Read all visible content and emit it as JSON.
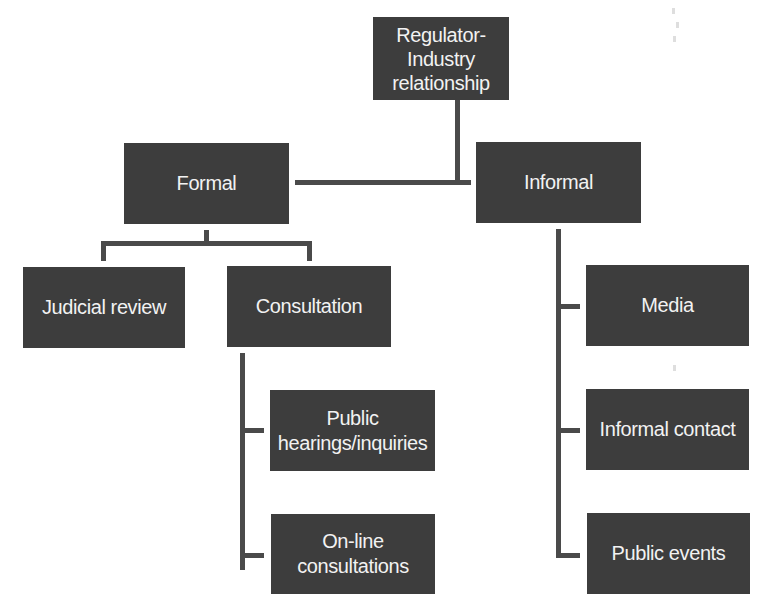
{
  "diagram": {
    "type": "org-tree",
    "colors": {
      "box_fill": "#3d3d3d",
      "box_text": "#f2f2f2",
      "connector": "#4a4a4a",
      "background": "#ffffff"
    },
    "root": {
      "label": "Regulator-\nIndustry\nrelationship"
    },
    "branches": [
      {
        "label": "Formal",
        "children": [
          {
            "label": "Judicial review"
          },
          {
            "label": "Consultation",
            "children": [
              {
                "label": "Public\nhearings/inquiries"
              },
              {
                "label": "On-line\nconsultations"
              }
            ]
          }
        ]
      },
      {
        "label": "Informal",
        "children": [
          {
            "label": "Media"
          },
          {
            "label": "Informal contact"
          },
          {
            "label": "Public events"
          }
        ]
      }
    ]
  }
}
